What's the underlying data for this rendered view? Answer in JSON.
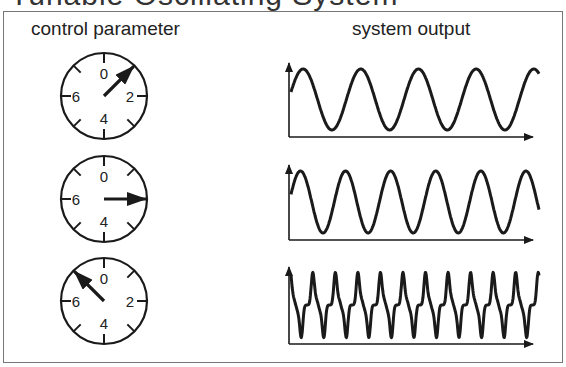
{
  "title_partial": "Tunable Oscillating System",
  "headers": {
    "left": "control parameter",
    "right": "system output"
  },
  "dials": [
    {
      "labels": {
        "top": "0",
        "left": "6",
        "right": "2",
        "bottom": "4"
      },
      "arrow_angle_deg": 45,
      "setting_approx": 1
    },
    {
      "labels": {
        "top": "0",
        "left": "6",
        "right": "",
        "bottom": "4"
      },
      "arrow_angle_deg": 90,
      "setting_approx": 2
    },
    {
      "labels": {
        "top": "0",
        "left": "6",
        "right": "2",
        "bottom": "4"
      },
      "arrow_angle_deg": -45,
      "setting_approx": 7
    }
  ],
  "outputs": [
    {
      "waveform": "sine",
      "cycles": 4.3,
      "description": "low-frequency sine wave"
    },
    {
      "waveform": "sine",
      "cycles": 5.5,
      "description": "higher-frequency sine wave"
    },
    {
      "waveform": "sharp-peaked oscillation",
      "cycles": 11,
      "description": "high-frequency complex periodic wave"
    }
  ],
  "colors": {
    "line": "#1a1a1a",
    "frame": "#777777",
    "background": "#ffffff"
  }
}
